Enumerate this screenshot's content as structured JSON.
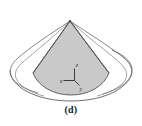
{
  "figure": {
    "caption": "(d)",
    "kind": "3d-solid-diagram",
    "background_color": "#ffffff",
    "shaded_fill_color": "#c9c9c9",
    "outline_color": "#4a4a4a",
    "axis_color": "#2b2b2b",
    "description_parts": {
      "shaded_region_name": "shaded-cone-wedge",
      "left_lobe_name": "left-white-lobe",
      "right_lobe_name": "right-white-lobe",
      "base_ellipse_name": "base-ellipse",
      "apex_name": "apex-point"
    },
    "axes": {
      "origin_label": "",
      "items": [
        {
          "id": "z",
          "label": "z",
          "direction": "up"
        },
        {
          "id": "x",
          "label": "x",
          "direction": "left"
        },
        {
          "id": "y",
          "label": "y",
          "direction": "down-right"
        }
      ]
    }
  }
}
